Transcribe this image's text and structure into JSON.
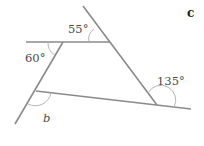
{
  "diagram": {
    "part_label": "c",
    "angles": {
      "top": "55°",
      "left": "60°",
      "right": "135°",
      "unknown": "b"
    },
    "colors": {
      "line": "#8a8a8a",
      "arc": "#b5b5b5",
      "text": "#4a4a4a"
    }
  }
}
